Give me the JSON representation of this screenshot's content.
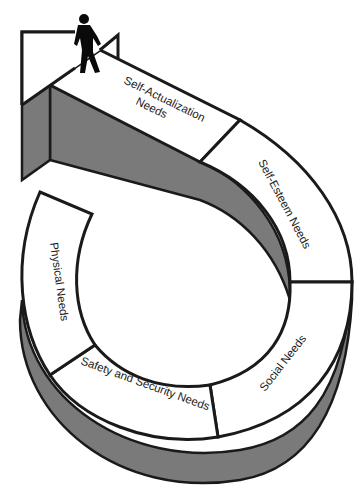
{
  "diagram": {
    "colors": {
      "background": "#ffffff",
      "outline": "#1a1a1a",
      "side_shade": "#7a7a7a",
      "path_fill": "#ffffff"
    },
    "figure": "walking-person-icon",
    "stages": [
      {
        "id": "physical",
        "label": "Physical Needs",
        "order": 1
      },
      {
        "id": "safety",
        "label": "Safety and Security Needs",
        "order": 2
      },
      {
        "id": "social",
        "label": "Social Needs",
        "order": 3
      },
      {
        "id": "esteem",
        "label": "Self-Esteem Needs",
        "order": 4
      },
      {
        "id": "actualization",
        "label_line1": "Self-Actualization",
        "label_line2": "Needs",
        "order": 5
      }
    ]
  }
}
